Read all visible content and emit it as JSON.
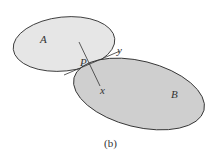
{
  "figure": {
    "caption": "(b)",
    "labels": {
      "body_a": "A",
      "body_b": "B",
      "contact_point": "P",
      "normal_axis": "x",
      "tangent_axis": "y"
    },
    "colors": {
      "body_a_fill": "#e6e6e6",
      "body_b_fill": "#cfcfcf",
      "stroke": "#333333"
    }
  }
}
